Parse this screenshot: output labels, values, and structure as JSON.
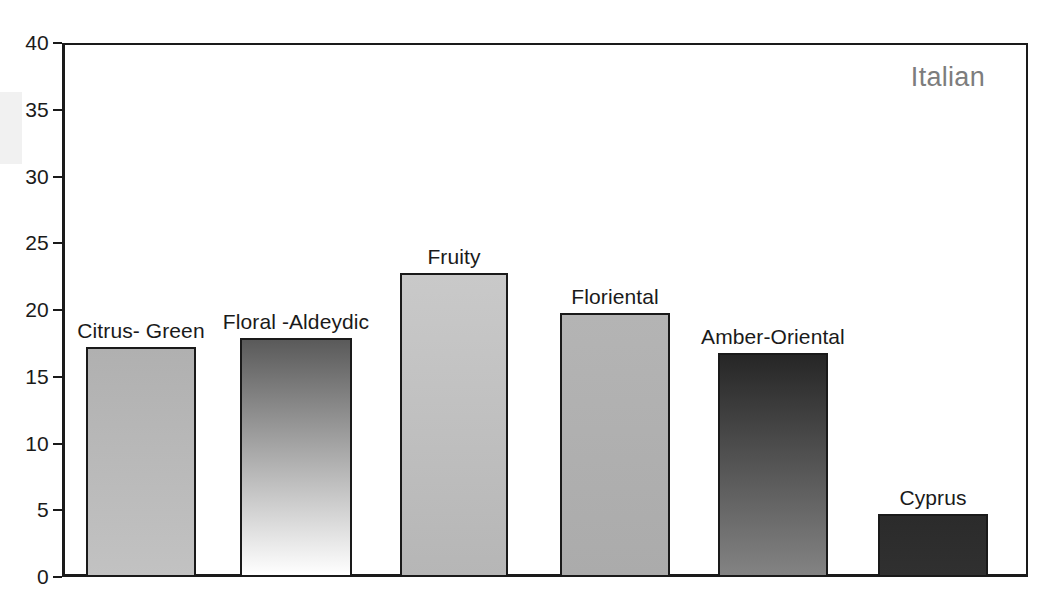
{
  "chart_data": {
    "type": "bar",
    "title": "",
    "subtitle": "",
    "annotation": "Italian",
    "xlabel": "",
    "ylabel": "",
    "ylim": [
      0,
      40
    ],
    "grid": false,
    "legend_position": "none",
    "categories": [
      "Citrus- Green",
      "Floral -Aldeydic",
      "Fruity",
      "Floriental",
      "Amber-Oriental",
      "Cyprus"
    ],
    "values": [
      17.2,
      17.9,
      22.8,
      19.8,
      16.8,
      4.7
    ],
    "ytick_labels": [
      "0",
      "5",
      "10",
      "15",
      "20",
      "25",
      "30",
      "35",
      "40"
    ],
    "ytick_values": [
      0,
      5,
      10,
      15,
      20,
      25,
      30,
      35,
      40
    ],
    "bar_styles": [
      {
        "name": "Citrus- Green",
        "fill_top": "#b0b0b0",
        "fill_bottom": "#c2c2c2",
        "edge": "#1a1a1a"
      },
      {
        "name": "Floral -Aldeydic",
        "fill_top": "#5a5a5a",
        "fill_bottom": "#ffffff",
        "edge": "#1a1a1a"
      },
      {
        "name": "Fruity",
        "fill_top": "#c9c9c9",
        "fill_bottom": "#b6b6b6",
        "edge": "#1a1a1a"
      },
      {
        "name": "Floriental",
        "fill_top": "#b4b4b4",
        "fill_bottom": "#ababab",
        "edge": "#1a1a1a"
      },
      {
        "name": "Amber-Oriental",
        "fill_top": "#262626",
        "fill_bottom": "#838383",
        "edge": "#1a1a1a"
      },
      {
        "name": "Cyprus",
        "fill_top": "#2b2b2b",
        "fill_bottom": "#303030",
        "edge": "#1a1a1a"
      }
    ],
    "colors": {
      "axis": "#1a1a1a",
      "text": "#1a1a1a",
      "annotation": "#7d7d7d",
      "background": "#ffffff"
    }
  }
}
